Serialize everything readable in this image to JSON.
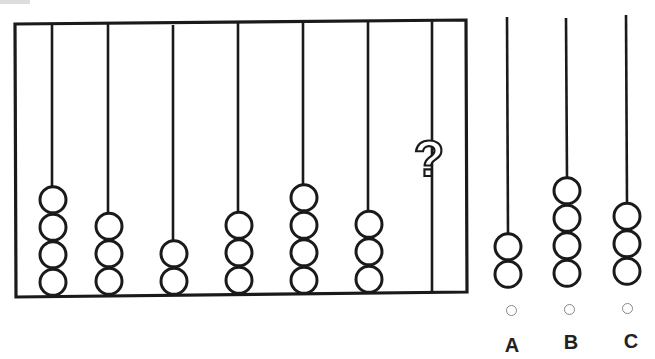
{
  "puzzle": {
    "type": "abacus-sequence",
    "frame_rods": [
      {
        "index": 1,
        "beads": 4
      },
      {
        "index": 2,
        "beads": 3
      },
      {
        "index": 3,
        "beads": 2
      },
      {
        "index": 4,
        "beads": 3
      },
      {
        "index": 5,
        "beads": 4
      },
      {
        "index": 6,
        "beads": 3
      },
      {
        "index": 7,
        "beads": null,
        "marker": "?"
      }
    ],
    "question_mark": "?",
    "options": [
      {
        "label": "A",
        "beads": 2
      },
      {
        "label": "B",
        "beads": 4
      },
      {
        "label": "C",
        "beads": 3
      }
    ]
  },
  "colors": {
    "line": "#1a1a1a",
    "radio_border": "#888888",
    "label": "#222222",
    "background": "#ffffff"
  }
}
